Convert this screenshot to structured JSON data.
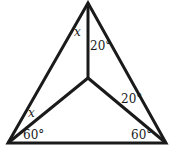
{
  "diagram": {
    "type": "geometry-triangle",
    "vertices": {
      "top": [
        88,
        3
      ],
      "bottom_left": [
        8,
        143
      ],
      "bottom_right": [
        166,
        143
      ],
      "interior": [
        88,
        78
      ]
    },
    "labels": {
      "top_left_angle": "x",
      "top_right_angle": "20°",
      "bottom_left_upper_angle": "x",
      "bottom_left_lower_angle": "60°",
      "right_upper_angle": "20°",
      "bottom_right_angle": "60°"
    },
    "stroke_color": "#1a1a1a"
  }
}
